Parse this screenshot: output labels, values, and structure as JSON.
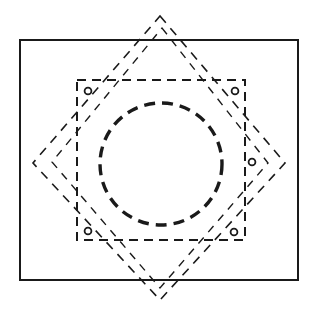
{
  "figure": {
    "canvas": {
      "width": 317,
      "height": 319
    },
    "colors": {
      "ink": "#1a1a1a",
      "background": "#ffffff"
    }
  },
  "shapes": {
    "frame_rectangle": {
      "name": "outer rectangle",
      "x": 20,
      "y": 40,
      "width": 278,
      "height": 240,
      "stroke_width": 2,
      "style": "solid"
    },
    "dashed_square": {
      "name": "axis aligned dashed square",
      "x": 77,
      "y": 80,
      "width": 168,
      "height": 160,
      "stroke_width": 2,
      "dash": "9 6",
      "style": "dashed"
    },
    "rotated_square_outer": {
      "name": "rotated dashed square outer",
      "points": "160,16 285,163 160,300 33,163",
      "stroke_width": 1.6,
      "dash": "9 7",
      "style": "dashed"
    },
    "rotated_square_inner": {
      "name": "rotated dashed square inner",
      "points": "162,28 268,163 160,288 52,162",
      "stroke_width": 1.4,
      "dash": "8 7",
      "style": "dashed"
    },
    "center_circle": {
      "name": "bold dashed circle",
      "cx": 161,
      "cy": 164,
      "r": 61,
      "stroke_width": 3.4,
      "dash": "11 7",
      "style": "dashed"
    },
    "marker_circles": [
      {
        "name": "marker-top-left",
        "cx": 88,
        "cy": 91,
        "r": 3.4
      },
      {
        "name": "marker-top-right",
        "cx": 235,
        "cy": 91,
        "r": 3.4
      },
      {
        "name": "marker-right",
        "cx": 252,
        "cy": 162,
        "r": 3.4
      },
      {
        "name": "marker-bottom-left",
        "cx": 88,
        "cy": 231,
        "r": 3.4
      },
      {
        "name": "marker-bottom-right",
        "cx": 234,
        "cy": 232,
        "r": 3.4
      }
    ]
  }
}
